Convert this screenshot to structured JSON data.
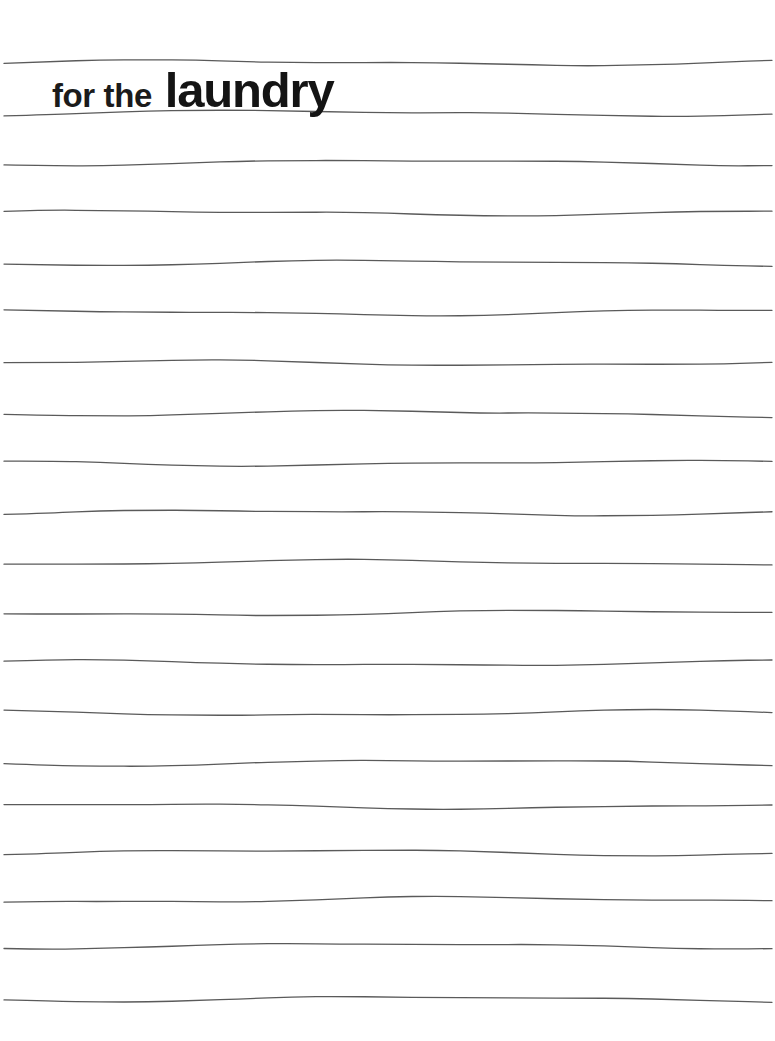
{
  "page": {
    "kind": "lined-notepad-page",
    "width": 775,
    "height": 1041,
    "background_color": "#ffffff"
  },
  "heading": {
    "lead_text": "for the",
    "emphasis_text": "laundry",
    "full_text": "for the laundry",
    "lead_color": "#1b1b1b",
    "emphasis_color": "#141414",
    "left": 52,
    "baseline_y": 105
  },
  "rules": {
    "name": "horizontal-writing-lines",
    "count": 20,
    "spacing": 50,
    "color": "#5a5a5a",
    "stroke_width": 1.3,
    "x_start": 4,
    "x_end": 772,
    "wavy": true,
    "wave_amplitude": 2.4,
    "y_positions": [
      63,
      113,
      163,
      213,
      263,
      313,
      363,
      413,
      463,
      513,
      563,
      613,
      663,
      713,
      763,
      806,
      852,
      900,
      946,
      999
    ]
  }
}
